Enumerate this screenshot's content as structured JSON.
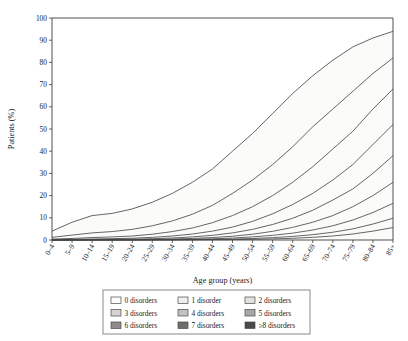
{
  "chart_data": {
    "type": "area",
    "title": "",
    "xlabel": "Age group (years)",
    "ylabel": "Patients (%)",
    "stacked": true,
    "stack_mode": "cumulative",
    "grid": false,
    "legend_position": "bottom",
    "ylim": [
      0,
      100
    ],
    "yticks": [
      0,
      10,
      20,
      30,
      40,
      50,
      60,
      70,
      80,
      90,
      100
    ],
    "ytick_labels": [
      "0",
      "10",
      "20",
      "30",
      "40",
      "50",
      "60",
      "70",
      "80",
      "90",
      "100"
    ],
    "categories": [
      "0–4",
      "5–9",
      "10–14",
      "15–19",
      "20–24",
      "25–29",
      "30–34",
      "35–39",
      "40–44",
      "45–49",
      "50–54",
      "55–59",
      "60–64",
      "65–69",
      "70–74",
      "75–79",
      "80–84",
      "85+"
    ],
    "series": [
      {
        "name": "0 disorders",
        "color": "#fbfbfa",
        "cumulative": [
          4,
          8,
          11,
          12,
          14,
          17,
          21,
          26,
          32,
          40,
          48,
          57,
          66,
          74,
          81,
          87,
          91,
          94
        ]
      },
      {
        "name": "1 disorder",
        "color": "#f0efed",
        "cumulative": [
          1.2,
          2.2,
          3.2,
          3.8,
          4.8,
          6.4,
          8.6,
          11.6,
          15.6,
          21,
          27,
          34,
          42,
          51,
          59,
          67,
          75,
          82
        ]
      },
      {
        "name": "2 disorders",
        "color": "#e3e2df",
        "cumulative": [
          0.4,
          0.7,
          1.1,
          1.4,
          1.8,
          2.6,
          3.8,
          5.4,
          7.8,
          11,
          15,
          20,
          26,
          33,
          41,
          49,
          59,
          68
        ]
      },
      {
        "name": "3 disorders",
        "color": "#d4d3cf",
        "cumulative": [
          0.15,
          0.3,
          0.45,
          0.6,
          0.8,
          1.2,
          1.8,
          2.7,
          4.0,
          5.8,
          8.4,
          11.8,
          16,
          21,
          27,
          34,
          43,
          52
        ]
      },
      {
        "name": "4 disorders",
        "color": "#c2c1bd",
        "cumulative": [
          0.06,
          0.12,
          0.2,
          0.28,
          0.38,
          0.58,
          0.9,
          1.4,
          2.1,
          3.2,
          4.8,
          7.0,
          9.8,
          13.4,
          18,
          23,
          30,
          38
        ]
      },
      {
        "name": "5 disorders",
        "color": "#a9a8a4",
        "cumulative": [
          0.02,
          0.05,
          0.08,
          0.12,
          0.17,
          0.27,
          0.43,
          0.7,
          1.1,
          1.7,
          2.6,
          3.9,
          5.7,
          8.0,
          11,
          15,
          20,
          26
        ]
      },
      {
        "name": "6 disorders",
        "color": "#8e8d89",
        "cumulative": [
          0.01,
          0.02,
          0.03,
          0.05,
          0.07,
          0.12,
          0.2,
          0.33,
          0.54,
          0.88,
          1.4,
          2.1,
          3.1,
          4.5,
          6.4,
          9.0,
          12.4,
          16.5
        ]
      },
      {
        "name": "7 disorders",
        "color": "#6f6e6b",
        "cumulative": [
          0.004,
          0.008,
          0.013,
          0.02,
          0.03,
          0.05,
          0.09,
          0.15,
          0.25,
          0.42,
          0.68,
          1.05,
          1.6,
          2.4,
          3.5,
          5.0,
          7.2,
          9.8
        ]
      },
      {
        "name": "≥8 disorders",
        "color": "#4a4947",
        "cumulative": [
          0.002,
          0.003,
          0.005,
          0.008,
          0.012,
          0.02,
          0.035,
          0.06,
          0.1,
          0.18,
          0.3,
          0.48,
          0.76,
          1.2,
          1.8,
          2.7,
          4.0,
          5.6
        ]
      }
    ]
  },
  "legend": {
    "entries": [
      "0 disorders",
      "1 disorder",
      "2 disorders",
      "3 disorders",
      "4 disorders",
      "5 disorders",
      "6 disorders",
      "7 disorders",
      "≥8 disorders"
    ]
  }
}
